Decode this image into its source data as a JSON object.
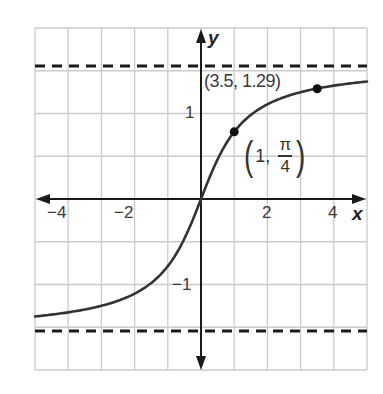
{
  "chart_data": {
    "type": "line",
    "title": "",
    "function": "y = arctan(x)",
    "xlabel": "x",
    "ylabel": "y",
    "xlim": [
      -5,
      5
    ],
    "ylim": [
      -2,
      2
    ],
    "grid": true,
    "grid_step": {
      "x": 1,
      "y": 0.5
    },
    "x_ticks": [
      -4,
      -2,
      2,
      4
    ],
    "x_tick_labels": [
      "−4",
      "−2",
      "2",
      "4"
    ],
    "y_ticks": [
      1,
      -1
    ],
    "y_tick_labels": [
      "1",
      "−1"
    ],
    "asymptotes": [
      {
        "type": "horizontal",
        "y": 1.5708,
        "label": "y = π/2",
        "style": "dashed"
      },
      {
        "type": "horizontal",
        "y": -1.5708,
        "label": "y = −π/2",
        "style": "dashed"
      }
    ],
    "series": [
      {
        "name": "arctan(x)",
        "x": [
          -5,
          -4,
          -3,
          -2,
          -1,
          -0.5,
          0,
          0.5,
          1,
          2,
          3,
          3.5,
          4,
          5
        ],
        "y": [
          -1.3734,
          -1.3258,
          -1.249,
          -1.1071,
          -0.7854,
          -0.4636,
          0,
          0.4636,
          0.7854,
          1.1071,
          1.249,
          1.2925,
          1.3258,
          1.3734
        ]
      }
    ],
    "points": [
      {
        "x": 1,
        "y": 0.7854,
        "label": "(1, π/4)"
      },
      {
        "x": 3.5,
        "y": 1.29,
        "label": "(3.5, 1.29)"
      }
    ]
  },
  "labels": {
    "x_axis": "x",
    "y_axis": "y",
    "xtick_m4": "−4",
    "xtick_m2": "−2",
    "xtick_2": "2",
    "xtick_4": "4",
    "ytick_1": "1",
    "ytick_m1": "−1",
    "point_a": "(3.5, 1.29)",
    "point_b_x": "1,",
    "point_b_num": "π",
    "point_b_den": "4",
    "paren_open": "(",
    "paren_close": ")"
  },
  "colors": {
    "grid": "#c8c8c8",
    "axis": "#1a1a1a",
    "curve": "#333333",
    "dash": "#1a1a1a"
  }
}
